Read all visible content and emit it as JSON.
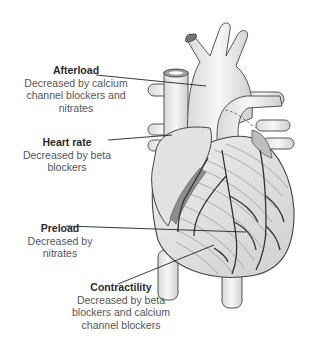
{
  "figure": {
    "labels": [
      {
        "id": "afterload",
        "title": "Afterload",
        "description": "Decreased by calcium channel blockers and nitrates",
        "lines": [
          "Decreased by calcium",
          "channel blockers and",
          "nitrates"
        ]
      },
      {
        "id": "heart-rate",
        "title": "Heart rate",
        "description": "Decreased by beta blockers",
        "lines": [
          "Decreased by beta",
          "blockers"
        ]
      },
      {
        "id": "preload",
        "title": "Preload",
        "description": "Decreased by nitrates",
        "lines": [
          "Decreased by",
          "nitrates"
        ]
      },
      {
        "id": "contractility",
        "title": "Contractility",
        "description": "Decreased by beta blockers and calcium channel blockers",
        "lines": [
          "Decreased by beta",
          "blockers and calcium",
          "channel blockers"
        ]
      }
    ]
  }
}
